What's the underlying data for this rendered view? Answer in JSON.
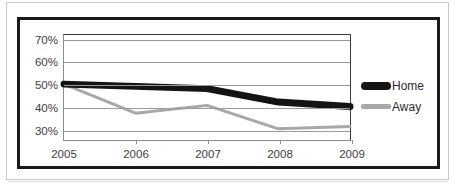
{
  "chart_data": {
    "type": "line",
    "title": "",
    "subtitle": "",
    "xlabel": "",
    "ylabel": "",
    "categories": [
      "2005",
      "2006",
      "2007",
      "2008",
      "2009"
    ],
    "series": [
      {
        "name": "Home",
        "values": [
          50,
          49,
          48,
          42,
          40
        ],
        "color": "#141414",
        "line_width_px": 7
      },
      {
        "name": "Away",
        "values": [
          50,
          37,
          40.5,
          30,
          31
        ],
        "color": "#a8a8a8",
        "line_width_px": 3
      }
    ],
    "ylim": [
      25,
      72
    ],
    "yticks": [
      30,
      40,
      50,
      60,
      70
    ],
    "ytick_labels": [
      "30%",
      "40%",
      "50%",
      "60%",
      "70%"
    ],
    "grid": "horizontal",
    "legend_position": "right",
    "legend_entries": [
      "Home",
      "Away"
    ],
    "annotations": []
  },
  "legend": {
    "home_label": "Home",
    "away_label": "Away"
  },
  "axes": {
    "y_tick_labels": [
      "70%",
      "60%",
      "50%",
      "40%",
      "30%"
    ],
    "x_tick_labels": [
      "2005",
      "2006",
      "2007",
      "2008",
      "2009"
    ]
  }
}
